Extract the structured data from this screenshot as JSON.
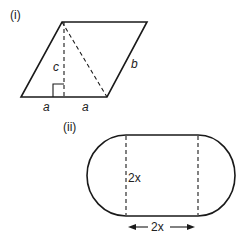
{
  "figure_i": {
    "label": "(i)",
    "height_label": "c",
    "side_label": "b",
    "base_left_label": "a",
    "base_right_label": "a"
  },
  "figure_ii": {
    "label": "(ii)",
    "height_label": "2x",
    "width_label": "2x"
  },
  "colors": {
    "stroke": "#1a1a1a",
    "background": "#ffffff"
  }
}
